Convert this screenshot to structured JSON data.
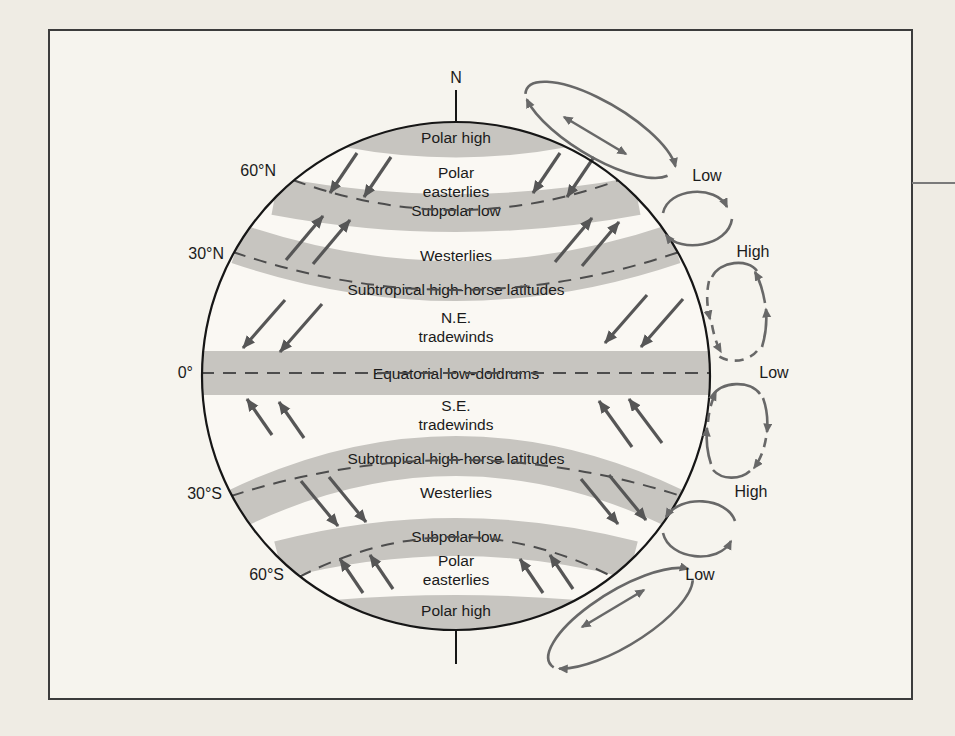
{
  "figure": {
    "pole_label": "N"
  },
  "latitudes": [
    "60°N",
    "30°N",
    "0°",
    "30°S",
    "60°S"
  ],
  "belts": [
    {
      "label": "Polar high"
    },
    {
      "line1": "Polar",
      "line2": "easterlies"
    },
    {
      "label": "Subpolar low"
    },
    {
      "label": "Westerlies"
    },
    {
      "label": "Subtropical high-horse latitudes"
    },
    {
      "line1": "N.E.",
      "line2": "tradewinds"
    },
    {
      "label": "Equatorial low-doldrums"
    },
    {
      "line1": "S.E.",
      "line2": "tradewinds"
    },
    {
      "label": "Subtropical high-horse latitudes"
    },
    {
      "label": "Westerlies"
    },
    {
      "label": "Subpolar low"
    },
    {
      "line1": "Polar",
      "line2": "easterlies"
    },
    {
      "label": "Polar high"
    }
  ],
  "pressure": [
    "Low",
    "High",
    "Low",
    "High",
    "Low"
  ],
  "colors": {
    "paper": "#efece4",
    "panel": "#f6f4ee",
    "globe": "#faf8f3",
    "band_gray": "#c7c5c0",
    "dash_line": "#4d4d4d",
    "arrow": "#565656",
    "cell": "#686868",
    "ink": "#1b1b1b",
    "border": "#3c3c3c"
  }
}
